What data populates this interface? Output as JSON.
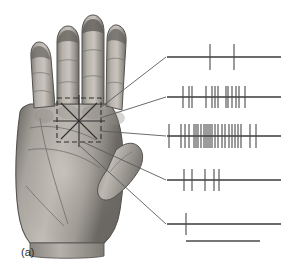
{
  "figure": {
    "panel_label": "(a)",
    "caption_hidden": "",
    "background_color": "#ffffff",
    "width": 296,
    "height": 272
  },
  "hand": {
    "name": "human-hand-palm-photograph",
    "description": "grayscale photograph of a human hand, palmar surface, four fingers extended upward and thumb to the right",
    "skin_tone_light": "#c8c4bd",
    "skin_tone_mid": "#9a968f",
    "skin_tone_dark": "#6d6a65",
    "outline_color": "#55534f",
    "receptive_field": {
      "name": "receptive-field-marker",
      "box": {
        "x": 57,
        "y": 98,
        "width": 44,
        "height": 44
      },
      "center": {
        "x": 79,
        "y": 121
      },
      "dash_color": "#2f2f2f",
      "star_color": "#2f2f2f",
      "star_rays": 8,
      "star_radius": 26
    }
  },
  "connectors": {
    "name": "leader-lines",
    "color": "#5a5a5a",
    "lines": [
      {
        "x1": 100,
        "y1": 108,
        "x2": 166,
        "y2": 57
      },
      {
        "x1": 100,
        "y1": 118,
        "x2": 166,
        "y2": 97
      },
      {
        "x1": 101,
        "y1": 131,
        "x2": 166,
        "y2": 136
      },
      {
        "x1": 83,
        "y1": 142,
        "x2": 166,
        "y2": 180
      },
      {
        "x1": 79,
        "y1": 145,
        "x2": 166,
        "y2": 224
      }
    ]
  },
  "chart_data": {
    "type": "raster",
    "title": "",
    "xlabel": "",
    "ylabel": "",
    "axis": {
      "x_start": 167,
      "x_end": 281,
      "grid": false
    },
    "baseline_color": "#3a3a3a",
    "spike_color": "#4a4a4a",
    "traces": [
      {
        "label": "trace-1",
        "baseline_y": 57,
        "spike_count": 2,
        "spike_height_up": 13,
        "spike_height_down": 13,
        "spikes": [
          210,
          234
        ]
      },
      {
        "label": "trace-2",
        "baseline_y": 97,
        "spike_count": 13,
        "spike_height_up": 11,
        "spike_height_down": 11,
        "spikes": [
          183,
          189,
          192,
          206,
          212,
          215,
          218,
          226,
          228,
          232,
          236,
          239,
          245
        ]
      },
      {
        "label": "trace-3",
        "baseline_y": 136,
        "spike_count": 24,
        "spike_height_up": 12,
        "spike_height_down": 12,
        "spikes": [
          169,
          181,
          185,
          189,
          194,
          196,
          198,
          201,
          204,
          206,
          208,
          210,
          212,
          215,
          218,
          222,
          225,
          229,
          232,
          235,
          238,
          241,
          250,
          256
        ]
      },
      {
        "label": "trace-4",
        "baseline_y": 180,
        "spike_count": 5,
        "spike_height_up": 11,
        "spike_height_down": 11,
        "spikes": [
          184,
          192,
          205,
          214,
          219
        ]
      },
      {
        "label": "trace-5",
        "baseline_y": 224,
        "spike_count": 1,
        "spike_height_up": 11,
        "spike_height_down": 11,
        "spikes": [
          186
        ]
      }
    ],
    "scale_bar": {
      "name": "time-scale-bar",
      "x1": 186,
      "x2": 260,
      "y": 241,
      "color": "#4a4a4a",
      "label": ""
    }
  }
}
